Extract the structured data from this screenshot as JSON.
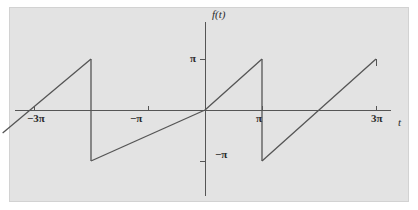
{
  "figure": {
    "background_color": "#e3e3e3",
    "page_color": "#ffffff",
    "line_color": "#555555",
    "axis_color": "#555555",
    "text_color": "#2b2b2b"
  },
  "labels": {
    "y_axis_name": "f(t)",
    "x_axis_name": "t",
    "y_tick_pi": "π",
    "y_tick_neg_pi": "−π",
    "x_tick_neg_3pi": "−3π",
    "x_tick_neg_pi": "−π",
    "x_tick_pi": "π",
    "x_tick_3pi": "3π"
  },
  "chart_data": {
    "type": "line",
    "title": "",
    "xlabel": "t",
    "ylabel": "f(t)",
    "xlim": [
      -3.8,
      3.4
    ],
    "ylim": [
      -1.25,
      1.25
    ],
    "xlim_units": "multiples of π",
    "ylim_units": "multiples of π",
    "grid": false,
    "legend": null,
    "xticks": [
      -3,
      -1,
      1,
      3
    ],
    "xtick_labels": [
      "−3π",
      "−π",
      "π",
      "3π"
    ],
    "yticks": [
      -1,
      1
    ],
    "ytick_labels": [
      "−π",
      "π"
    ],
    "period": 2,
    "amplitude": 1,
    "series": [
      {
        "name": "f(t)",
        "segments": [
          {
            "x": [
              -3.55,
              -2.0
            ],
            "y": [
              -0.45,
              1.0
            ]
          },
          {
            "x": [
              -2.0,
              -2.0
            ],
            "y": [
              1.0,
              -1.0
            ]
          },
          {
            "x": [
              -2.0,
              0.0
            ],
            "y": [
              -1.0,
              0.0
            ]
          },
          {
            "x": [
              0.0,
              0.0
            ],
            "y": [
              0.0,
              0.0
            ]
          },
          {
            "x": [
              0.0,
              1.0
            ],
            "y": [
              0.0,
              1.0
            ]
          },
          {
            "x": [
              1.0,
              1.0
            ],
            "y": [
              1.0,
              -1.0
            ]
          },
          {
            "x": [
              1.0,
              3.0
            ],
            "y": [
              -1.0,
              1.0
            ]
          }
        ]
      }
    ]
  },
  "pixel_geometry": {
    "origin_x": 205,
    "origin_y": 110,
    "pi_x_px": 57,
    "pi_y_px": 51,
    "x_axis_left": 15,
    "x_axis_right": 391,
    "y_axis_top": 22,
    "y_axis_bottom": 196
  }
}
